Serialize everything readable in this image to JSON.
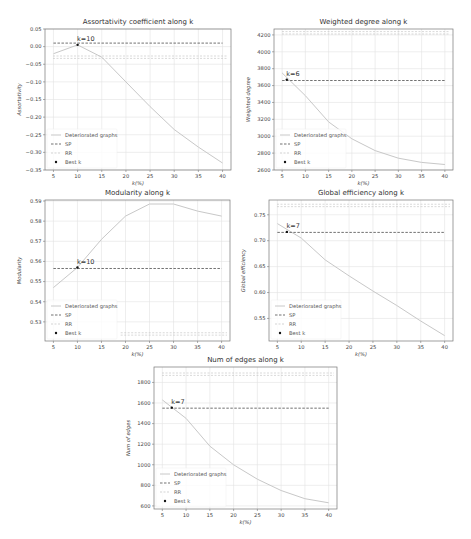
{
  "chart_data": [
    {
      "type": "line",
      "title": "Assortativity coefficient along k",
      "xlabel": "k(%)",
      "ylabel": "Assortativity",
      "x": [
        5,
        10,
        15,
        20,
        25,
        30,
        35,
        40
      ],
      "series": [
        {
          "name": "Deteriorated graphs",
          "values": [
            -0.02,
            0.005,
            -0.03,
            -0.1,
            -0.17,
            -0.235,
            -0.285,
            -0.33
          ]
        },
        {
          "name": "SP",
          "constant": 0.01
        },
        {
          "name": "RR",
          "constant": -0.03
        }
      ],
      "best_k": {
        "x": 10,
        "y": 0.005,
        "label": "k=10"
      },
      "xticks": [
        5,
        10,
        15,
        20,
        25,
        30,
        35,
        40
      ],
      "yticks": [
        0.05,
        0.0,
        -0.05,
        -0.1,
        -0.15,
        -0.2,
        -0.25,
        -0.3,
        -0.35
      ],
      "ytick_labels": [
        "0.05",
        "0.00",
        "−0.05",
        "−0.10",
        "−0.15",
        "−0.20",
        "−0.25",
        "−0.30",
        "−0.35"
      ],
      "ylim": [
        -0.35,
        0.05
      ],
      "xlim": [
        3.25,
        41.75
      ],
      "grid": true,
      "legend_position": "lower left",
      "box": {
        "left": 45,
        "right": 231,
        "top": 29,
        "bottom": 170
      }
    },
    {
      "type": "line",
      "title": "Weighted degree along k",
      "xlabel": "k(%)",
      "ylabel": "Weighted degree",
      "x": [
        5,
        10,
        15,
        20,
        25,
        30,
        35,
        40
      ],
      "series": [
        {
          "name": "Deteriorated graphs",
          "values": [
            3750,
            3480,
            3170,
            2970,
            2830,
            2740,
            2690,
            2665
          ]
        },
        {
          "name": "SP",
          "constant": 3660
        },
        {
          "name": "RR",
          "constant": 4225
        }
      ],
      "best_k": {
        "x": 6,
        "y": 3670,
        "label": "k=6"
      },
      "xticks": [
        5,
        10,
        15,
        20,
        25,
        30,
        35,
        40
      ],
      "yticks": [
        4200,
        4000,
        3800,
        3600,
        3400,
        3200,
        3000,
        2800,
        2600
      ],
      "ytick_labels": [
        "4200",
        "4000",
        "3800",
        "3600",
        "3400",
        "3200",
        "3000",
        "2800",
        "2600"
      ],
      "ylim": [
        2600,
        4270
      ],
      "xlim": [
        3.25,
        41.75
      ],
      "grid": true,
      "legend_position": "lower left",
      "box": {
        "left": 274,
        "right": 453,
        "top": 29,
        "bottom": 170
      }
    },
    {
      "type": "line",
      "title": "Modularity along k",
      "xlabel": "k(%)",
      "ylabel": "Modularity",
      "x": [
        5,
        10,
        15,
        20,
        25,
        30,
        35,
        40
      ],
      "series": [
        {
          "name": "Deteriorated graphs",
          "values": [
            0.547,
            0.557,
            0.571,
            0.5825,
            0.5885,
            0.5885,
            0.585,
            0.5825
          ]
        },
        {
          "name": "SP",
          "constant": 0.5565
        },
        {
          "name": "RR",
          "constant": 0.524
        }
      ],
      "best_k": {
        "x": 10,
        "y": 0.557,
        "label": "k=10"
      },
      "xticks": [
        5,
        10,
        15,
        20,
        25,
        30,
        35,
        40
      ],
      "yticks": [
        0.59,
        0.58,
        0.57,
        0.56,
        0.55,
        0.54,
        0.53
      ],
      "ytick_labels": [
        "0.59",
        "0.58",
        "0.57",
        "0.56",
        "0.55",
        "0.54",
        "0.53"
      ],
      "ylim": [
        0.5205,
        0.5905
      ],
      "xlim": [
        3.25,
        41.75
      ],
      "grid": true,
      "legend_position": "lower left",
      "box": {
        "left": 45,
        "right": 230,
        "top": 200,
        "bottom": 341
      }
    },
    {
      "type": "line",
      "title": "Global efficiency along k",
      "xlabel": "k(%)",
      "ylabel": "Global efficiency",
      "x": [
        5,
        10,
        15,
        20,
        25,
        30,
        35,
        40
      ],
      "series": [
        {
          "name": "Deteriorated graphs",
          "values": [
            0.733,
            0.705,
            0.663,
            0.632,
            0.603,
            0.575,
            0.545,
            0.517
          ]
        },
        {
          "name": "SP",
          "constant": 0.716
        },
        {
          "name": "RR",
          "constant": 0.768
        }
      ],
      "best_k": {
        "x": 7,
        "y": 0.717,
        "label": "k=7"
      },
      "xticks": [
        5,
        10,
        15,
        20,
        25,
        30,
        35,
        40
      ],
      "yticks": [
        0.75,
        0.7,
        0.65,
        0.6,
        0.55
      ],
      "ytick_labels": [
        "0.75",
        "0.70",
        "0.65",
        "0.60",
        "0.55"
      ],
      "ylim": [
        0.5065,
        0.7785
      ],
      "xlim": [
        3.25,
        41.75
      ],
      "grid": true,
      "legend_position": "lower left",
      "box": {
        "left": 269,
        "right": 453,
        "top": 200,
        "bottom": 341
      }
    },
    {
      "type": "line",
      "title": "Num of edges along k",
      "xlabel": "k(%)",
      "ylabel": "Num of edges",
      "x": [
        5,
        10,
        15,
        20,
        25,
        30,
        35,
        40
      ],
      "series": [
        {
          "name": "Deteriorated graphs",
          "values": [
            1630,
            1450,
            1180,
            1000,
            860,
            750,
            670,
            630
          ]
        },
        {
          "name": "SP",
          "constant": 1550
        },
        {
          "name": "RR",
          "constant": 1880
        }
      ],
      "best_k": {
        "x": 7,
        "y": 1555,
        "label": "k=7"
      },
      "xticks": [
        5,
        10,
        15,
        20,
        25,
        30,
        35,
        40
      ],
      "yticks": [
        1800,
        1600,
        1400,
        1200,
        1000,
        800,
        600
      ],
      "ytick_labels": [
        "1800",
        "1600",
        "1400",
        "1200",
        "1000",
        "800",
        "600"
      ],
      "ylim": [
        570,
        1950
      ],
      "xlim": [
        3.25,
        41.75
      ],
      "grid": true,
      "legend_position": "lower left",
      "box": {
        "left": 154,
        "right": 337,
        "top": 367,
        "bottom": 509
      }
    }
  ],
  "legend": {
    "entries": [
      "Deteriorated graphs",
      "SP",
      "RR",
      "Best k"
    ]
  },
  "colors": {
    "line": "#c8c8c8",
    "sp": "#333333",
    "rr": "#c0c0c0",
    "grid": "#e2e2e2",
    "axis": "#777777",
    "marker": "#111111"
  }
}
